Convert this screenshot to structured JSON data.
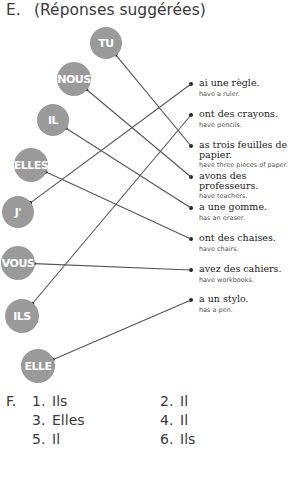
{
  "section_e": {
    "letter": "E.",
    "title": "(Réponses suggérées)"
  },
  "subjects": [
    {
      "label": "TU",
      "cx": 106,
      "cy": 43,
      "r": 16,
      "matches": 2
    },
    {
      "label": "NOUS",
      "cx": 74,
      "cy": 79,
      "r": 17,
      "matches": 3
    },
    {
      "label": "IL",
      "cx": 53,
      "cy": 120,
      "r": 16,
      "matches": 4
    },
    {
      "label": "ELLES",
      "cx": 31,
      "cy": 165,
      "r": 17,
      "matches": 5
    },
    {
      "label": "J'",
      "cx": 18,
      "cy": 212,
      "r": 16,
      "matches": 0
    },
    {
      "label": "VOUS",
      "cx": 18,
      "cy": 263,
      "r": 17,
      "matches": 6
    },
    {
      "label": "ILS",
      "cx": 22,
      "cy": 316,
      "r": 17,
      "matches": 1
    },
    {
      "label": "ELLE",
      "cx": 38,
      "cy": 366,
      "r": 17,
      "matches": 7
    }
  ],
  "answers": [
    {
      "fr": "ai une règle.",
      "en": "have a ruler.",
      "dot_y": 84
    },
    {
      "fr": "ont des crayons.",
      "en": "have pencils.",
      "dot_y": 115
    },
    {
      "fr": "as trois feuilles de papier.",
      "en": "have three pieces of paper.",
      "dot_y": 146
    },
    {
      "fr": "avons des professeurs.",
      "en": "have teachers.",
      "dot_y": 177
    },
    {
      "fr": "a une gomme.",
      "en": "has an eraser.",
      "dot_y": 208
    },
    {
      "fr": "ont des chaises.",
      "en": "have chairs.",
      "dot_y": 239
    },
    {
      "fr": "avez des cahiers.",
      "en": "have workbooks.",
      "dot_y": 270
    },
    {
      "fr": "a un stylo.",
      "en": "has a pen.",
      "dot_y": 300
    }
  ],
  "section_f": {
    "letter": "F.",
    "items": [
      {
        "num": "1.",
        "answer": "Ils"
      },
      {
        "num": "2.",
        "answer": "Il"
      },
      {
        "num": "3.",
        "answer": "Elles"
      },
      {
        "num": "4.",
        "answer": "Il"
      },
      {
        "num": "5.",
        "answer": "Il"
      },
      {
        "num": "6.",
        "answer": "Ils"
      }
    ]
  },
  "colors": {
    "bubble": "#9a9a9a",
    "line": "#555555"
  }
}
